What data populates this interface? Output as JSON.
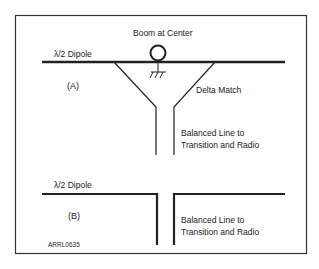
{
  "diagram": {
    "colors": {
      "line": "#222222",
      "frame": "#333333",
      "background": "#ffffff"
    },
    "panel_a": {
      "tag": "(A)",
      "dipole_label": "λ/2 Dipole",
      "boom_label": "Boom at Center",
      "match_label": "Delta Match",
      "feed_label_line1": "Balanced Line to",
      "feed_label_line2": "Transition and Radio"
    },
    "panel_b": {
      "tag": "(B)",
      "dipole_label": "λ/2 Dipole",
      "feed_label_line1": "Balanced Line to",
      "feed_label_line2": "Transition and Radio"
    },
    "figure_id": "ARRL0635"
  }
}
